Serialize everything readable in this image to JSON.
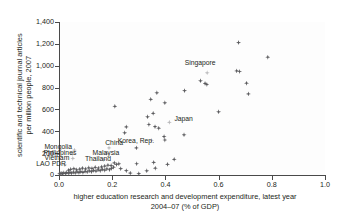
{
  "chart_data": {
    "type": "scatter",
    "title": "",
    "xlabel": "higher education research and development expenditure, latest year 2004–07 (% of GDP)",
    "xlabel_line1": "higher education research and development expenditure, latest year",
    "xlabel_line2": "2004–07 (% of GDP)",
    "ylabel": "scientific and technical journal articles per million people, 2007",
    "ylabel_line1": "scientific and technical journal articles",
    "ylabel_line2": "per million people, 2007",
    "xlim": [
      0.0,
      1.0
    ],
    "ylim": [
      0,
      1400
    ],
    "xticks": [
      "0.0",
      "0.2",
      "0.4",
      "0.6",
      "0.8",
      "1.0"
    ],
    "xtick_values": [
      0.0,
      0.2,
      0.4,
      0.6,
      0.8,
      1.0
    ],
    "yticks": [
      "0",
      "200",
      "400",
      "600",
      "800",
      "1,000",
      "1,200",
      "1,400"
    ],
    "ytick_values": [
      0,
      200,
      400,
      600,
      800,
      1000,
      1200,
      1400
    ],
    "grid": false,
    "legend": null,
    "marker_color": "#5b5b5e",
    "highlight_color": "#b9b9bb",
    "annotations": [
      {
        "label": "Singapore",
        "x": 0.555,
        "y": 935
      },
      {
        "label": "Japan",
        "x": 0.415,
        "y": 482
      },
      {
        "label": "Korea, Rep.",
        "x": 0.345,
        "y": 318
      },
      {
        "label": "Mongolia",
        "x": 0.058,
        "y": 228
      },
      {
        "label": "China",
        "x": 0.185,
        "y": 248
      },
      {
        "label": "Philippines",
        "x": 0.028,
        "y": 196
      },
      {
        "label": "Malaysia",
        "x": 0.175,
        "y": 196
      },
      {
        "label": "Vietnam",
        "x": 0.032,
        "y": 152
      },
      {
        "label": "Thailand",
        "x": 0.15,
        "y": 140
      },
      {
        "label": "LAO PDR",
        "x": 0.012,
        "y": 92
      }
    ],
    "points": [
      {
        "x": 0.675,
        "y": 1212
      },
      {
        "x": 0.785,
        "y": 1078
      },
      {
        "x": 0.668,
        "y": 952
      },
      {
        "x": 0.679,
        "y": 947
      },
      {
        "x": 0.557,
        "y": 935,
        "highlight": true,
        "label": "Singapore"
      },
      {
        "x": 0.705,
        "y": 840
      },
      {
        "x": 0.532,
        "y": 862
      },
      {
        "x": 0.549,
        "y": 838
      },
      {
        "x": 0.556,
        "y": 828
      },
      {
        "x": 0.712,
        "y": 742
      },
      {
        "x": 0.472,
        "y": 772
      },
      {
        "x": 0.368,
        "y": 752
      },
      {
        "x": 0.345,
        "y": 692
      },
      {
        "x": 0.398,
        "y": 660
      },
      {
        "x": 0.21,
        "y": 628
      },
      {
        "x": 0.6,
        "y": 578
      },
      {
        "x": 0.354,
        "y": 564
      },
      {
        "x": 0.333,
        "y": 532
      },
      {
        "x": 0.415,
        "y": 482,
        "highlight": true,
        "label": "Japan"
      },
      {
        "x": 0.338,
        "y": 462
      },
      {
        "x": 0.253,
        "y": 440
      },
      {
        "x": 0.361,
        "y": 442
      },
      {
        "x": 0.375,
        "y": 428
      },
      {
        "x": 0.247,
        "y": 386
      },
      {
        "x": 0.47,
        "y": 368
      },
      {
        "x": 0.395,
        "y": 352
      },
      {
        "x": 0.348,
        "y": 318,
        "highlight": true,
        "label": "Korea, Rep."
      },
      {
        "x": 0.398,
        "y": 320
      },
      {
        "x": 0.291,
        "y": 248
      },
      {
        "x": 0.188,
        "y": 248,
        "highlight": true,
        "label": "China"
      },
      {
        "x": 0.058,
        "y": 228,
        "highlight": true,
        "label": "Mongolia"
      },
      {
        "x": 0.178,
        "y": 196,
        "highlight": true,
        "label": "Malaysia"
      },
      {
        "x": 0.05,
        "y": 196,
        "highlight": true,
        "label": "Philippines"
      },
      {
        "x": 0.052,
        "y": 152,
        "highlight": true,
        "label": "Vietnam"
      },
      {
        "x": 0.168,
        "y": 140,
        "highlight": true,
        "label": "Thailand"
      },
      {
        "x": 0.022,
        "y": 92,
        "highlight": true,
        "label": "LAO PDR"
      },
      {
        "x": 0.433,
        "y": 143
      },
      {
        "x": 0.292,
        "y": 103
      },
      {
        "x": 0.356,
        "y": 115
      },
      {
        "x": 0.408,
        "y": 98
      },
      {
        "x": 0.362,
        "y": 62
      },
      {
        "x": 0.33,
        "y": 38
      },
      {
        "x": 0.253,
        "y": 40
      },
      {
        "x": 0.225,
        "y": 102
      },
      {
        "x": 0.216,
        "y": 96
      },
      {
        "x": 0.205,
        "y": 72
      },
      {
        "x": 0.197,
        "y": 60
      },
      {
        "x": 0.19,
        "y": 48
      },
      {
        "x": 0.18,
        "y": 56
      },
      {
        "x": 0.172,
        "y": 44
      },
      {
        "x": 0.163,
        "y": 52
      },
      {
        "x": 0.155,
        "y": 40
      },
      {
        "x": 0.147,
        "y": 46
      },
      {
        "x": 0.139,
        "y": 36
      },
      {
        "x": 0.13,
        "y": 42
      },
      {
        "x": 0.122,
        "y": 30
      },
      {
        "x": 0.114,
        "y": 38
      },
      {
        "x": 0.106,
        "y": 28
      },
      {
        "x": 0.098,
        "y": 34
      },
      {
        "x": 0.09,
        "y": 24
      },
      {
        "x": 0.082,
        "y": 30
      },
      {
        "x": 0.075,
        "y": 22
      },
      {
        "x": 0.068,
        "y": 28
      },
      {
        "x": 0.061,
        "y": 20
      },
      {
        "x": 0.054,
        "y": 26
      },
      {
        "x": 0.047,
        "y": 18
      },
      {
        "x": 0.041,
        "y": 24
      },
      {
        "x": 0.035,
        "y": 16
      },
      {
        "x": 0.029,
        "y": 22
      },
      {
        "x": 0.024,
        "y": 14
      },
      {
        "x": 0.018,
        "y": 20
      },
      {
        "x": 0.013,
        "y": 12
      },
      {
        "x": 0.008,
        "y": 18
      },
      {
        "x": 0.004,
        "y": 10
      },
      {
        "x": 0.002,
        "y": 16
      },
      {
        "x": 0.036,
        "y": 44
      },
      {
        "x": 0.044,
        "y": 52
      },
      {
        "x": 0.056,
        "y": 58
      },
      {
        "x": 0.066,
        "y": 48
      },
      {
        "x": 0.078,
        "y": 54
      },
      {
        "x": 0.088,
        "y": 62
      },
      {
        "x": 0.1,
        "y": 56
      },
      {
        "x": 0.112,
        "y": 66
      },
      {
        "x": 0.124,
        "y": 60
      },
      {
        "x": 0.136,
        "y": 70
      },
      {
        "x": 0.148,
        "y": 64
      },
      {
        "x": 0.16,
        "y": 74
      },
      {
        "x": 0.172,
        "y": 82
      },
      {
        "x": 0.184,
        "y": 90
      },
      {
        "x": 0.196,
        "y": 86
      },
      {
        "x": 0.208,
        "y": 110
      },
      {
        "x": 0.232,
        "y": 58
      },
      {
        "x": 0.268,
        "y": 18
      },
      {
        "x": 0.3,
        "y": 12
      }
    ]
  }
}
